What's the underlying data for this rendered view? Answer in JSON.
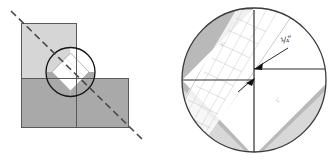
{
  "figure": {
    "panels": [
      {
        "id": "left-panel",
        "name": "l-shape-block-overview",
        "description": "L-shaped block of three squares with dashed diagonal cutting line and circular magnifier outline at the inner corner",
        "shapes": {
          "top_left_square": {
            "fill": "#d6d6d6",
            "stroke": "#5a5a5a"
          },
          "bottom_left_square": {
            "fill": "#a9a9a9",
            "stroke": "#5a5a5a"
          },
          "bottom_right_square": {
            "fill": "#a9a9a9",
            "stroke": "#5a5a5a"
          },
          "diagonal_line": {
            "style": "dashed",
            "stroke": "#4a4a4a"
          },
          "magnifier_circle": {
            "stroke": "#1a1a1a",
            "fill": "none"
          },
          "inner_diamond": {
            "fill": "#ffffff",
            "stroke": "#8c8c8c"
          }
        }
      },
      {
        "id": "right-panel",
        "name": "magnified-ruler-detail",
        "description": "Magnified circular view of the corner showing a transparent quilting ruler laid on the diagonal with the quarter inch mark aligned to the seam intersection",
        "shapes": {
          "magnifier_circle": {
            "stroke": "#3a3a3a",
            "fill": "#ffffff"
          },
          "shaded_fabric_dark": {
            "fill": "#b9b9b9"
          },
          "shaded_fabric_light": {
            "fill": "#d8d8d8"
          },
          "ruler_band": {
            "fill": "#ffffff",
            "stroke": "#cfcfcf"
          },
          "seam_lines": {
            "stroke": "#333333"
          }
        },
        "callouts": [
          {
            "name": "quarter-inch-callout",
            "text": "¼\"",
            "arrow": "points down-left to the seam intersection point"
          }
        ],
        "ruler_labels": [
          {
            "name": "ruler-mark-upper",
            "text": "1⁄₂"
          },
          {
            "name": "ruler-mark-lower",
            "text": "1\""
          }
        ],
        "markers": [
          {
            "name": "corner-point-upper",
            "shape": "arrowhead-dot"
          },
          {
            "name": "corner-point-center",
            "shape": "arrowhead-dot"
          }
        ]
      }
    ]
  }
}
